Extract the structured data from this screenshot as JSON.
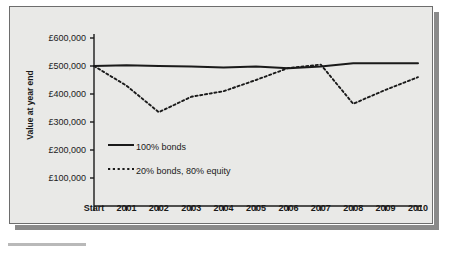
{
  "figure": {
    "background_color": "#e9e9e7",
    "border_color": "#6d6d6d",
    "shadow_color": "#8a8a8a"
  },
  "chart_data": {
    "type": "line",
    "title": "",
    "xlabel": "",
    "ylabel": "Value at year end",
    "categories": [
      "Start",
      "2001",
      "2002",
      "2003",
      "2004",
      "2005",
      "2006",
      "2007",
      "2008",
      "2009",
      "2010"
    ],
    "ylim": [
      0,
      600000
    ],
    "ytick_values": [
      100000,
      200000,
      300000,
      400000,
      500000,
      600000
    ],
    "ytick_labels": [
      "£100,000",
      "£200,000",
      "£300,000",
      "£400,000",
      "£500,000",
      "£600,000"
    ],
    "grid": false,
    "legend_position": "inside-lower-left",
    "currency_symbol": "£",
    "series": [
      {
        "name": "100% bonds",
        "style": "solid",
        "color": "#1a1a1a",
        "values": [
          500000,
          503000,
          500000,
          498000,
          495000,
          498000,
          492000,
          498000,
          510000,
          510000,
          510000
        ]
      },
      {
        "name": "20% bonds, 80% equity",
        "style": "dotted",
        "color": "#1a1a1a",
        "values": [
          500000,
          430000,
          335000,
          390000,
          410000,
          450000,
          493000,
          505000,
          365000,
          415000,
          460000
        ]
      }
    ]
  },
  "legend": {
    "entries": [
      {
        "label": "100% bonds",
        "style": "solid"
      },
      {
        "label": "20% bonds, 80% equity",
        "style": "dotted"
      }
    ]
  }
}
